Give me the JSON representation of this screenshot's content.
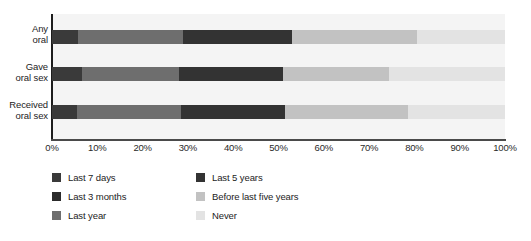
{
  "chart_data": {
    "type": "bar",
    "orientation": "horizontal",
    "stacked": true,
    "stack_mode": "percent",
    "title": "",
    "subtitle": "",
    "xlabel": "",
    "ylabel": "",
    "xlim": [
      0,
      100
    ],
    "grid": false,
    "legend_position": "bottom-left",
    "categories": [
      "Any oral",
      "Gave oral sex",
      "Received oral sex"
    ],
    "category_lines": [
      [
        "Any",
        "oral"
      ],
      [
        "Gave",
        "oral sex"
      ],
      [
        "Received",
        "oral sex"
      ]
    ],
    "xticks": [
      0,
      10,
      20,
      30,
      40,
      50,
      60,
      70,
      80,
      90,
      100
    ],
    "xticklabels": [
      "0%",
      "10%",
      "20%",
      "30%",
      "40%",
      "50%",
      "60%",
      "70%",
      "80%",
      "90%",
      "100%"
    ],
    "series": [
      {
        "name": "Last 7 days",
        "color": "#3a3a3a",
        "values": [
          5.7,
          6.6,
          5.5
        ]
      },
      {
        "name": "Last 3 months",
        "color": "#2b2b2b",
        "values": [
          0,
          0,
          0
        ]
      },
      {
        "name": "Last year",
        "color": "#6e6e6e",
        "values": [
          23.3,
          21.4,
          23.0
        ]
      },
      {
        "name": "Last 5 years",
        "color": "#333333",
        "values": [
          24.0,
          23.0,
          23.0
        ]
      },
      {
        "name": "Before last five years",
        "color": "#c2c2c2",
        "values": [
          27.5,
          23.5,
          27.0
        ]
      },
      {
        "name": "Never",
        "color": "#e3e3e3",
        "values": [
          19.5,
          25.5,
          21.5
        ]
      }
    ],
    "stacks": [
      {
        "category": "Any oral",
        "segments": [
          {
            "label": "Last 7 days",
            "value": 5.7,
            "start": 0,
            "end": 5.7,
            "color": "#3a3a3a"
          },
          {
            "label": "Last year",
            "value": 23.3,
            "start": 5.7,
            "end": 29.0,
            "color": "#6e6e6e"
          },
          {
            "label": "Last 5 years",
            "value": 24.0,
            "start": 29.0,
            "end": 53.0,
            "color": "#333333"
          },
          {
            "label": "Before last five years",
            "value": 27.5,
            "start": 53.0,
            "end": 80.5,
            "color": "#c2c2c2"
          },
          {
            "label": "Never",
            "value": 19.5,
            "start": 80.5,
            "end": 100.0,
            "color": "#e3e3e3"
          }
        ]
      },
      {
        "category": "Gave oral sex",
        "segments": [
          {
            "label": "Last 7 days",
            "value": 6.6,
            "start": 0,
            "end": 6.6,
            "color": "#3a3a3a"
          },
          {
            "label": "Last year",
            "value": 21.4,
            "start": 6.6,
            "end": 28.0,
            "color": "#6e6e6e"
          },
          {
            "label": "Last 5 years",
            "value": 23.0,
            "start": 28.0,
            "end": 51.0,
            "color": "#333333"
          },
          {
            "label": "Before last five years",
            "value": 23.5,
            "start": 51.0,
            "end": 74.5,
            "color": "#c2c2c2"
          },
          {
            "label": "Never",
            "value": 25.5,
            "start": 74.5,
            "end": 100.0,
            "color": "#e3e3e3"
          }
        ]
      },
      {
        "category": "Received oral sex",
        "segments": [
          {
            "label": "Last 7 days",
            "value": 5.5,
            "start": 0,
            "end": 5.5,
            "color": "#3a3a3a"
          },
          {
            "label": "Last year",
            "value": 23.0,
            "start": 5.5,
            "end": 28.5,
            "color": "#6e6e6e"
          },
          {
            "label": "Last 5 years",
            "value": 23.0,
            "start": 28.5,
            "end": 51.5,
            "color": "#333333"
          },
          {
            "label": "Before last five years",
            "value": 27.0,
            "start": 51.5,
            "end": 78.5,
            "color": "#c2c2c2"
          },
          {
            "label": "Never",
            "value": 21.5,
            "start": 78.5,
            "end": 100.0,
            "color": "#e3e3e3"
          }
        ]
      }
    ],
    "legend": {
      "left_column": [
        {
          "label": "Last 7 days",
          "color": "#3a3a3a"
        },
        {
          "label": "Last 3 months",
          "color": "#2b2b2b"
        },
        {
          "label": "Last year",
          "color": "#6e6e6e"
        }
      ],
      "right_column": [
        {
          "label": "Last 5 years",
          "color": "#333333"
        },
        {
          "label": "Before last five years",
          "color": "#c2c2c2"
        },
        {
          "label": "Never",
          "color": "#e3e3e3"
        }
      ]
    },
    "colors": {
      "plot_background": "#f4f4f4",
      "page_background": "#ffffff",
      "axis": "#1d1d1d",
      "text": "#1c1c1c"
    }
  }
}
